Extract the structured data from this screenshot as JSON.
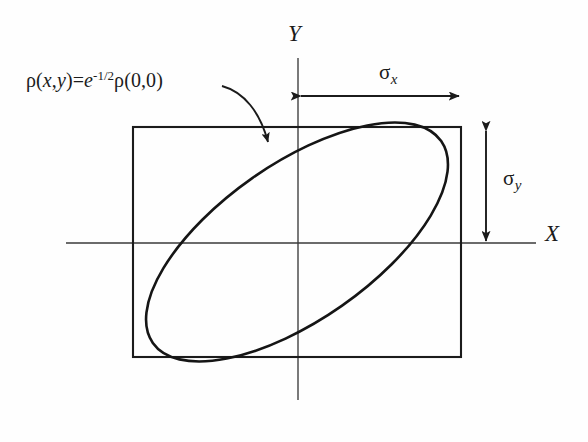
{
  "figure": {
    "type": "diagram",
    "width": 588,
    "height": 442,
    "background_color": "#fefefe",
    "stroke_color": "#1b1b1b"
  },
  "axes": {
    "x_label": "X",
    "y_label": "Y",
    "origin": {
      "x": 298,
      "y": 243
    },
    "x_axis": {
      "x_start": 66,
      "x_end": 536,
      "y": 243
    },
    "y_axis": {
      "x": 298,
      "y_start": 58,
      "y_end": 400
    }
  },
  "annotations": {
    "density_equation": {
      "rho": "ρ",
      "open_args": "(",
      "var_x": "x",
      "comma": ",",
      "var_y": "y",
      "close_args": ")",
      "equals": "=",
      "base_e": "e",
      "exponent_sign": "-",
      "exponent_value": "1/2",
      "rho2": "ρ",
      "zero_args": "(0,0)",
      "full_text": "ρ(x,y)=e-1/2ρ(0,0)"
    },
    "sigma_x": {
      "symbol": "σ",
      "subscript": "x"
    },
    "sigma_y": {
      "symbol": "σ",
      "subscript": "y"
    }
  },
  "shapes": {
    "rectangle": {
      "left": 133,
      "top": 127,
      "right": 461,
      "bottom": 357,
      "width": 328,
      "height": 230,
      "stroke_width": 2.1
    },
    "ellipse": {
      "center_x": 297,
      "center_y": 242,
      "radius_major": 176,
      "radius_minor": 78,
      "rotation_deg": -35,
      "stroke_width": 2.6,
      "tangent_points": [
        {
          "x": 415,
          "y": 128,
          "edge": "top"
        },
        {
          "x": 460,
          "y": 190,
          "edge": "right"
        },
        {
          "x": 180,
          "y": 356,
          "edge": "bottom"
        },
        {
          "x": 134,
          "y": 298,
          "edge": "left"
        }
      ]
    },
    "sigma_x_arrow": {
      "y": 96,
      "x_start": 300,
      "x_end": 461,
      "style": "double-headed"
    },
    "sigma_y_arrow": {
      "x": 486,
      "y_start": 129,
      "y_end": 243,
      "style": "double-headed"
    },
    "callout_arrow": {
      "start_x": 222,
      "start_y": 87,
      "end_x": 270,
      "end_y": 150,
      "style": "curved-single-head"
    }
  }
}
